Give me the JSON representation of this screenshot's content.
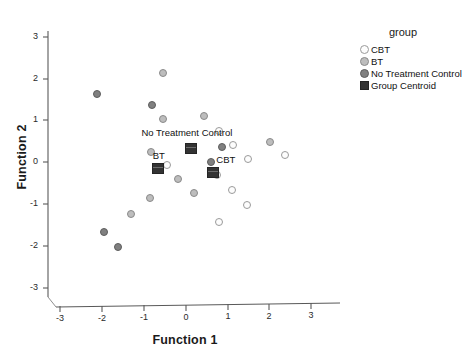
{
  "chart_data": {
    "type": "scatter",
    "title": "",
    "xlabel": "Function 1",
    "ylabel": "Function 2",
    "xlim": [
      -3.6,
      3.4
    ],
    "ylim": [
      -3.4,
      3.4
    ],
    "xticks": [
      "-3",
      "-2",
      "-1",
      "0",
      "1",
      "2",
      "3"
    ],
    "yticks": [
      "3",
      "2",
      "1",
      "0",
      "-1",
      "-2",
      "-3"
    ],
    "xtick_values": [
      -3,
      -2,
      -1,
      0,
      1,
      2,
      3
    ],
    "ytick_values": [
      3,
      2,
      1,
      0,
      -1,
      -2,
      -3
    ],
    "grid": false,
    "legend_position": "right",
    "legend_title": "group",
    "series": [
      {
        "name": "CBT",
        "marker": "open-circle",
        "color": "#fdfdfd",
        "edge_color": "#9a9a9a",
        "points": [
          {
            "x": 0.78,
            "y": 0.75
          },
          {
            "x": 1.13,
            "y": 0.41
          },
          {
            "x": 1.48,
            "y": 0.07
          },
          {
            "x": 2.36,
            "y": 0.16
          },
          {
            "x": 0.73,
            "y": -0.32
          },
          {
            "x": 1.1,
            "y": -0.68
          },
          {
            "x": 1.47,
            "y": -1.02
          },
          {
            "x": 0.8,
            "y": -1.43
          },
          {
            "x": -0.46,
            "y": -0.08
          }
        ]
      },
      {
        "name": "BT",
        "marker": "light-gray-circle",
        "color": "#bdbdbd",
        "edge_color": "#8a8a8a",
        "points": [
          {
            "x": -0.55,
            "y": 1.02
          },
          {
            "x": 0.43,
            "y": 1.1
          },
          {
            "x": -0.55,
            "y": 2.12
          },
          {
            "x": 2.02,
            "y": 0.49
          },
          {
            "x": -0.84,
            "y": 0.24
          },
          {
            "x": -0.18,
            "y": -0.41
          },
          {
            "x": 0.19,
            "y": -0.75
          },
          {
            "x": -0.85,
            "y": -0.85
          },
          {
            "x": -1.32,
            "y": -1.25
          }
        ]
      },
      {
        "name": "No Treatment Control",
        "marker": "gray-circle",
        "color": "#808080",
        "edge_color": "#5d5d5d",
        "points": [
          {
            "x": -2.12,
            "y": 1.63
          },
          {
            "x": -0.82,
            "y": 1.36
          },
          {
            "x": 0.61,
            "y": 0.0
          },
          {
            "x": 0.87,
            "y": 0.35
          },
          {
            "x": -1.95,
            "y": -1.67
          },
          {
            "x": -1.62,
            "y": -2.03
          }
        ]
      }
    ],
    "centroids": [
      {
        "label": "No Treatment Control",
        "x": 0.13,
        "y": 0.32,
        "label_dx": -1.1,
        "label_dy": 0.38
      },
      {
        "label": "BT",
        "x": -0.68,
        "y": -0.16,
        "label_dx": -0.02,
        "label_dy": 0.3
      },
      {
        "label": "CBT",
        "x": 0.65,
        "y": -0.26,
        "label_dx": 0.17,
        "label_dy": 0.3
      }
    ],
    "centroid_color": "#333333"
  },
  "legend": {
    "title": "group",
    "entries": [
      {
        "label": "CBT",
        "swatch": "open-circle-icon",
        "swatch_class": "cbt"
      },
      {
        "label": "BT",
        "swatch": "light-gray-circle-icon",
        "swatch_class": "bt"
      },
      {
        "label": "No Treatment Control",
        "swatch": "gray-circle-icon",
        "swatch_class": "ntc"
      },
      {
        "label": "Group Centroid",
        "swatch": "dark-square-icon",
        "swatch_class": "sq"
      }
    ]
  }
}
